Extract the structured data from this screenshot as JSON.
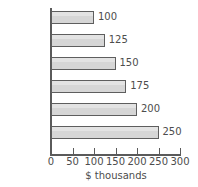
{
  "chart_data": {
    "type": "bar",
    "orientation": "horizontal",
    "title": "",
    "subtitle": "",
    "xlabel": "$ thousands",
    "ylabel": "",
    "categories": [
      "January",
      "February",
      "March",
      "April",
      "May",
      "June"
    ],
    "values": [
      100,
      125,
      150,
      175,
      200,
      250
    ],
    "data_labels": [
      "100",
      "125",
      "150",
      "175",
      "200",
      "250"
    ],
    "xlim": [
      0,
      300
    ],
    "xticks": [
      0,
      50,
      100,
      150,
      200,
      250,
      300
    ],
    "xtick_labels": [
      "0",
      "50",
      "100",
      "150",
      "200",
      "250",
      "300"
    ],
    "grid": false,
    "legend": null,
    "legend_position": "none",
    "colors": {
      "bar_fill": "#d6d6d6",
      "bar_border": "#5e5e5e",
      "axis": "#5a5a5a",
      "text": "#4d4d4d",
      "background": "#ffffff"
    }
  }
}
